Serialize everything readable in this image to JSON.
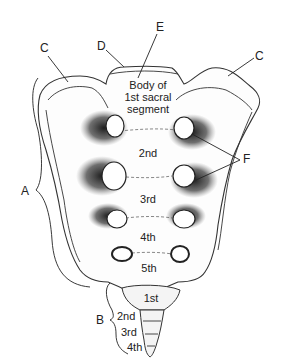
{
  "diagram": {
    "labels": {
      "A": "A",
      "B": "B",
      "C_left": "C",
      "C_right": "C",
      "D": "D",
      "E": "E",
      "F": "F"
    },
    "body_label": {
      "line1": "Body of",
      "line2": "1st sacral",
      "line3": "segment"
    },
    "sacral_segments": [
      "2nd",
      "3rd",
      "4th",
      "5th"
    ],
    "coccygeal_segments": [
      "1st",
      "2nd",
      "3rd",
      "4th"
    ],
    "colors": {
      "ink": "#222222",
      "background": "#ffffff",
      "shading": "#3a3a3a"
    }
  }
}
